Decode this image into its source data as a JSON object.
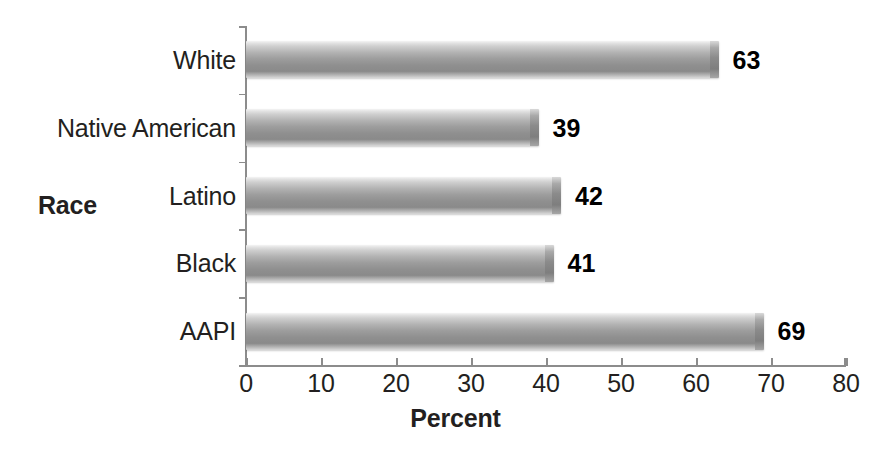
{
  "chart_data": {
    "type": "bar",
    "orientation": "horizontal",
    "title": "",
    "xlabel": "Percent",
    "ylabel": "Race",
    "categories": [
      "White",
      "Native American",
      "Latino",
      "Black",
      "AAPI"
    ],
    "values": [
      63,
      39,
      42,
      41,
      69
    ],
    "value_labels": [
      "63",
      "39",
      "42",
      "41",
      "69"
    ],
    "xlim": [
      0,
      80
    ],
    "xticks": [
      0,
      10,
      20,
      30,
      40,
      50,
      60,
      70,
      80
    ],
    "xtick_labels": [
      "0",
      "10",
      "20",
      "30",
      "40",
      "50",
      "60",
      "70",
      "80"
    ],
    "grid": false,
    "legend": false,
    "series": [
      {
        "name": "Percent",
        "values": [
          63,
          39,
          42,
          41,
          69
        ]
      }
    ],
    "bar_fill_description": "grayscale vertical gradient",
    "colors": {
      "bar_light": "#f4f4f4",
      "bar_mid": "#9d9d9d",
      "bar_dark": "#7e7e7e",
      "axis": "#8c8c8c",
      "text": "#231f20",
      "value_label": "#000000",
      "background": "#ffffff"
    }
  }
}
